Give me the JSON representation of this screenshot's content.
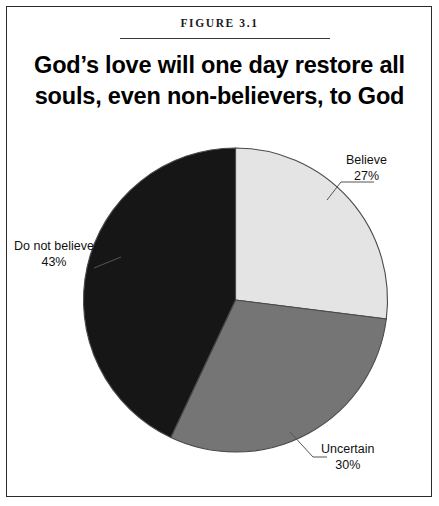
{
  "figure": {
    "label": "Figure 3.1",
    "title_line1": "God’s love will one day restore all",
    "title_line2": "souls, even non-believers, to God"
  },
  "labels": {
    "believe": {
      "name": "Believe",
      "pct": "27%"
    },
    "uncertain": {
      "name": "Uncertain",
      "pct": "30%"
    },
    "do_not_believe": {
      "name": "Do not believe",
      "pct": "43%"
    }
  },
  "colors": {
    "believe": "#e4e4e4",
    "uncertain": "#757575",
    "do_not_believe": "#161616",
    "outline": "#4a4a4a",
    "frame": "#2b2b2b",
    "text": "#111111"
  },
  "chart_data": {
    "type": "pie",
    "title": "God’s love will one day restore all souls, even non-believers, to God",
    "subtitle": "Figure 3.1",
    "xlabel": "",
    "ylabel": "",
    "legend_position": "none",
    "labels_on_slices": true,
    "start_angle_deg": 0,
    "direction": "clockwise",
    "categories": [
      "Believe",
      "Uncertain",
      "Do not believe"
    ],
    "values": [
      27,
      30,
      43
    ],
    "value_unit": "percent",
    "slice_colors": [
      "#e4e4e4",
      "#757575",
      "#161616"
    ],
    "data_labels": [
      "Believe 27%",
      "Uncertain 30%",
      "Do not believe 43%"
    ]
  }
}
